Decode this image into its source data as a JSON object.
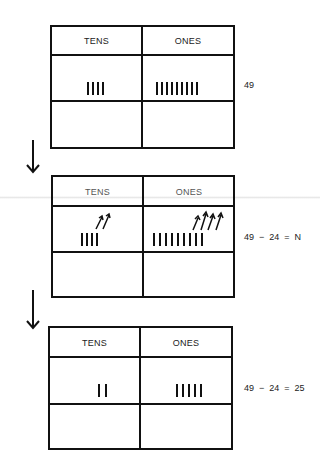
{
  "steps": [
    {
      "headers": {
        "tens": "TENS",
        "ones": "ONES"
      },
      "tens_tally": 4,
      "ones_tally": 9,
      "equation": "49"
    },
    {
      "headers": {
        "tens": "TENS",
        "ones": "ONES"
      },
      "tens_tally": 4,
      "ones_tally": 9,
      "tens_removed": 2,
      "ones_removed": 4,
      "equation": "49  −  24  =  N"
    },
    {
      "headers": {
        "tens": "TENS",
        "ones": "ONES"
      },
      "tens_tally": 2,
      "ones_tally": 5,
      "equation": "49  −  24  =  25"
    }
  ],
  "arrows": [
    {
      "icon": "down-arrow-icon"
    },
    {
      "icon": "down-arrow-icon"
    }
  ]
}
